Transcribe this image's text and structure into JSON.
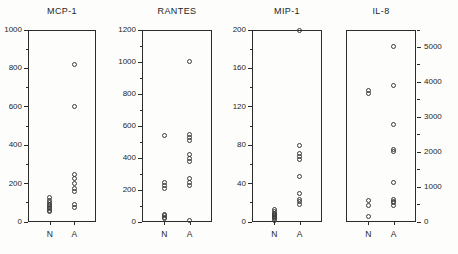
{
  "figure": {
    "background_color": "#fdfdfc",
    "marker_color": "#3a3a3a",
    "axis_color": "#2b2b2b"
  },
  "chart_data": [
    {
      "type": "scatter",
      "title": "MCP-1",
      "xlabel": "",
      "ylabel": "",
      "categories": [
        "N",
        "A"
      ],
      "ylim": [
        0,
        1000
      ],
      "yticks": [
        0,
        200,
        400,
        600,
        800,
        1000
      ],
      "ytick_labels": [
        "0",
        "200",
        "400",
        "600",
        "800",
        "1000"
      ],
      "minor_tick_step": 100,
      "axis_side": "left",
      "grid": false,
      "legend": "none",
      "series": [
        {
          "name": "N",
          "values": [
            55,
            60,
            70,
            75,
            85,
            90,
            100,
            110,
            130
          ]
        },
        {
          "name": "A",
          "values": [
            75,
            90,
            160,
            175,
            200,
            225,
            250,
            600,
            820
          ]
        }
      ]
    },
    {
      "type": "scatter",
      "title": "RANTES",
      "xlabel": "",
      "ylabel": "",
      "categories": [
        "N",
        "A"
      ],
      "ylim": [
        0,
        1200
      ],
      "yticks": [
        0,
        200,
        400,
        600,
        800,
        1000,
        1200
      ],
      "ytick_labels": [
        "0",
        "200",
        "400",
        "600",
        "800",
        "1000",
        "1200"
      ],
      "minor_tick_step": 100,
      "axis_side": "left",
      "grid": false,
      "legend": "none",
      "series": [
        {
          "name": "N",
          "values": [
            20,
            30,
            40,
            50,
            210,
            230,
            250,
            540
          ]
        },
        {
          "name": "A",
          "values": [
            10,
            230,
            250,
            270,
            380,
            400,
            420,
            510,
            530,
            550,
            1005
          ]
        }
      ]
    },
    {
      "type": "scatter",
      "title": "MIP-1",
      "xlabel": "",
      "ylabel": "",
      "categories": [
        "N",
        "A"
      ],
      "ylim": [
        0,
        200
      ],
      "yticks": [
        0,
        40,
        80,
        120,
        160,
        200
      ],
      "ytick_labels": [
        "0",
        "40",
        "80",
        "120",
        "160",
        "200"
      ],
      "minor_tick_step": 20,
      "axis_side": "left",
      "grid": false,
      "legend": "none",
      "series": [
        {
          "name": "N",
          "values": [
            2,
            4,
            5,
            6,
            7,
            8,
            9,
            11,
            13
          ]
        },
        {
          "name": "A",
          "values": [
            18,
            21,
            23,
            30,
            47,
            65,
            68,
            71,
            80,
            200
          ]
        }
      ]
    },
    {
      "type": "scatter",
      "title": "IL-8",
      "xlabel": "",
      "ylabel": "",
      "categories": [
        "N",
        "A"
      ],
      "ylim": [
        0,
        5500
      ],
      "yticks": [
        0,
        1000,
        2000,
        3000,
        4000,
        5000
      ],
      "ytick_labels": [
        "0",
        "1000",
        "2000",
        "3000",
        "4000",
        "5000"
      ],
      "minor_tick_step": 500,
      "axis_side": "right",
      "grid": false,
      "legend": "none",
      "series": [
        {
          "name": "N",
          "values": [
            150,
            480,
            620,
            3680,
            3760
          ]
        },
        {
          "name": "A",
          "values": [
            480,
            560,
            600,
            640,
            1130,
            2020,
            2080,
            2780,
            3900,
            5020
          ]
        }
      ]
    }
  ]
}
